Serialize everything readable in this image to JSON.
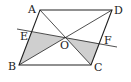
{
  "diagram": {
    "points": {
      "A": {
        "label": "A",
        "x": 40,
        "y": 10
      },
      "B": {
        "label": "B",
        "x": 19,
        "y": 65
      },
      "C": {
        "label": "C",
        "x": 91,
        "y": 65
      },
      "D": {
        "label": "D",
        "x": 112,
        "y": 10
      },
      "O": {
        "label": "O",
        "x": 65.5,
        "y": 37.5
      },
      "E": {
        "label": "E",
        "x": 31,
        "y": 32
      },
      "F": {
        "label": "F",
        "x": 100,
        "y": 43.5
      }
    },
    "shaded_regions": [
      "EBO",
      "OFC"
    ],
    "colors": {
      "stroke": "#222222",
      "shade": "#cfcfcf",
      "background": "#ffffff"
    }
  }
}
